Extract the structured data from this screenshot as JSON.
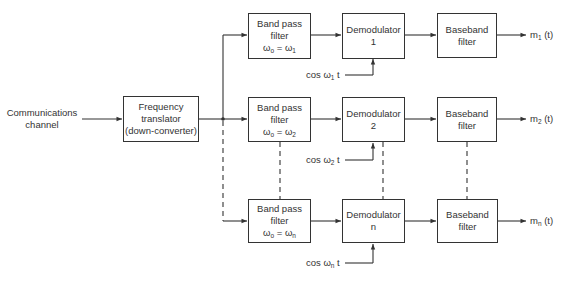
{
  "input": {
    "line1": "Communications",
    "line2": "channel"
  },
  "translator": {
    "line1": "Frequency",
    "line2": "translator",
    "line3": "(down-converter)"
  },
  "channels": [
    {
      "bpf": {
        "line1": "Band pass",
        "line2": "filter",
        "omega": "ω",
        "sub_o": "o",
        "eq": " = ω",
        "sub_k": "1"
      },
      "demod": {
        "line1": "Demodulator",
        "line2": "1"
      },
      "carrier": {
        "pre": "cos ω",
        "sub": "1",
        "post": " t"
      },
      "baseband": {
        "line1": "Baseband",
        "line2": "filter"
      },
      "output": {
        "pre": "m",
        "sub": "1",
        "post": " (t)"
      }
    },
    {
      "bpf": {
        "line1": "Band pass",
        "line2": "filter",
        "omega": "ω",
        "sub_o": "o",
        "eq": " = ω",
        "sub_k": "2"
      },
      "demod": {
        "line1": "Demodulator",
        "line2": "2"
      },
      "carrier": {
        "pre": "cos ω",
        "sub": "2",
        "post": " t"
      },
      "baseband": {
        "line1": "Baseband",
        "line2": "filter"
      },
      "output": {
        "pre": "m",
        "sub": "2",
        "post": " (t)"
      }
    },
    {
      "bpf": {
        "line1": "Band pass",
        "line2": "filter",
        "omega": "ω",
        "sub_o": "o",
        "eq": " = ω",
        "sub_k": "n"
      },
      "demod": {
        "line1": "Demodulator",
        "line2": "n"
      },
      "carrier": {
        "pre": "cos ω",
        "sub": "n",
        "post": " t"
      },
      "baseband": {
        "line1": "Baseband",
        "line2": "filter"
      },
      "output": {
        "pre": "m",
        "sub": "n",
        "post": " (t)"
      }
    }
  ],
  "colors": {
    "line": "#333333",
    "background": "#ffffff"
  }
}
